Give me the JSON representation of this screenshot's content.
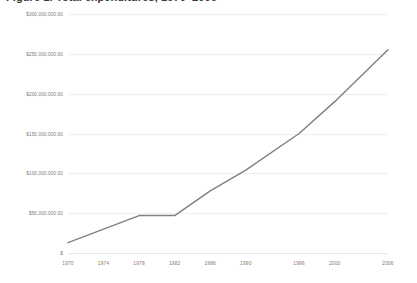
{
  "chart_data": {
    "type": "line",
    "title": "Figure 1. Total expenditures, 1970–2006",
    "xlabel": "",
    "ylabel": "",
    "grid": true,
    "legend": false,
    "xlim": [
      1970,
      2006
    ],
    "ylim": [
      0,
      300000000
    ],
    "x_tick_labels": [
      "1970",
      "1974",
      "1978",
      "1982",
      "1986",
      "1990",
      "1996",
      "2000",
      "2006"
    ],
    "x_tick_values": [
      1970,
      1974,
      1978,
      1982,
      1986,
      1990,
      1996,
      2000,
      2006
    ],
    "y_tick_labels": [
      "$300,000,000.00",
      "$250,000,000.00",
      "$200,000,000.00",
      "$150,000,000.00",
      "$100,000,000.00",
      "$50,000,000.00",
      "$"
    ],
    "y_tick_values": [
      300000000,
      250000000,
      200000000,
      150000000,
      100000000,
      50000000,
      0
    ],
    "series": [
      {
        "name": "Total expenditures",
        "color": "#808080",
        "x": [
          1970,
          1974,
          1978,
          1982,
          1986,
          1990,
          1996,
          2000,
          2006
        ],
        "values": [
          13000000,
          30000000,
          47000000,
          47000000,
          78000000,
          104000000,
          150000000,
          190000000,
          255000000
        ]
      }
    ]
  },
  "colors": {
    "line": "#808080",
    "gridline": "#eeeeee",
    "baseline": "#e6e6e6",
    "tick_text": "#777777",
    "title_text": "#3a3a3a",
    "background": "#ffffff"
  }
}
